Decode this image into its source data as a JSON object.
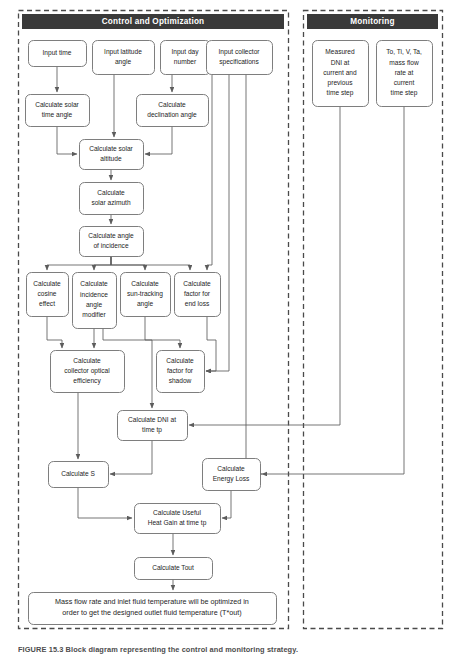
{
  "figure": {
    "caption": "FIGURE 15.3   Block diagram representing the control and monitoring strategy.",
    "background_color": "#ffffff",
    "header_fill": "#3a3a3a",
    "header_text_color": "#ffffff",
    "node_stroke": "#6f6f6f",
    "edge_color": "#5c5c5c",
    "panel_border_color": "#4a4a4a"
  },
  "panels": [
    {
      "id": "control",
      "title": "Control and Optimization",
      "x": 18,
      "y": 10,
      "width": 270,
      "height": 618
    },
    {
      "id": "monitoring",
      "title": "Monitoring",
      "x": 303,
      "y": 10,
      "width": 139,
      "height": 618
    }
  ],
  "nodes": [
    {
      "id": "input_time",
      "label": [
        "Input time"
      ],
      "x": 28,
      "y": 40,
      "w": 58,
      "h": 26,
      "panel": "control"
    },
    {
      "id": "input_latitude",
      "label": [
        "Input latitude",
        "angle"
      ],
      "x": 92,
      "y": 40,
      "w": 62,
      "h": 34,
      "panel": "control"
    },
    {
      "id": "input_day",
      "label": [
        "Input day",
        "number"
      ],
      "x": 160,
      "y": 40,
      "w": 50,
      "h": 34,
      "panel": "control"
    },
    {
      "id": "input_collector",
      "label": [
        "Input collector",
        "specifications"
      ],
      "x": 206,
      "y": 40,
      "w": 66,
      "h": 34,
      "panel": "control"
    },
    {
      "id": "calc_solar_time",
      "label": [
        "Calculate solar",
        "time angle"
      ],
      "x": 25,
      "y": 94,
      "w": 64,
      "h": 32,
      "panel": "control"
    },
    {
      "id": "calc_declination",
      "label": [
        "Calculate",
        "declination angle"
      ],
      "x": 136,
      "y": 94,
      "w": 72,
      "h": 32,
      "panel": "control"
    },
    {
      "id": "calc_altitude",
      "label": [
        "Calculate solar",
        "altitude"
      ],
      "x": 79,
      "y": 139,
      "w": 64,
      "h": 30,
      "panel": "control"
    },
    {
      "id": "calc_azimuth",
      "label": [
        "Calculate",
        "solar azimuth"
      ],
      "x": 79,
      "y": 182,
      "w": 64,
      "h": 32,
      "panel": "control"
    },
    {
      "id": "calc_incidence",
      "label": [
        "Calculate angle",
        "of incidence"
      ],
      "x": 79,
      "y": 226,
      "w": 64,
      "h": 30,
      "panel": "control"
    },
    {
      "id": "calc_cosine",
      "label": [
        "Calculate",
        "cosine",
        "effect"
      ],
      "x": 26,
      "y": 272,
      "w": 42,
      "h": 44,
      "panel": "control"
    },
    {
      "id": "calc_iam",
      "label": [
        "Calculate",
        "incidence",
        "angle",
        "modifier"
      ],
      "x": 72,
      "y": 272,
      "w": 44,
      "h": 56,
      "panel": "control"
    },
    {
      "id": "calc_suntrack",
      "label": [
        "Calculate",
        "sun-tracking",
        "angle"
      ],
      "x": 120,
      "y": 272,
      "w": 50,
      "h": 44,
      "panel": "control"
    },
    {
      "id": "calc_endloss",
      "label": [
        "Calculate",
        "factor for",
        "end loss"
      ],
      "x": 174,
      "y": 272,
      "w": 46,
      "h": 44,
      "panel": "control"
    },
    {
      "id": "calc_optical",
      "label": [
        "Calculate",
        "collector optical",
        "efficiency"
      ],
      "x": 50,
      "y": 350,
      "w": 74,
      "h": 42,
      "panel": "control"
    },
    {
      "id": "calc_shadow",
      "label": [
        "Calculate",
        "factor for",
        "shadow"
      ],
      "x": 156,
      "y": 350,
      "w": 48,
      "h": 42,
      "panel": "control"
    },
    {
      "id": "calc_dni",
      "label": [
        "Calculate DNI at",
        "time tp"
      ],
      "x": 117,
      "y": 410,
      "w": 70,
      "h": 30,
      "panel": "control"
    },
    {
      "id": "calc_s",
      "label": [
        "Calculate S"
      ],
      "x": 48,
      "y": 461,
      "w": 60,
      "h": 26,
      "panel": "control"
    },
    {
      "id": "calc_energyloss",
      "label": [
        "Calculate",
        "Energy Loss"
      ],
      "x": 202,
      "y": 458,
      "w": 58,
      "h": 32,
      "panel": "control"
    },
    {
      "id": "calc_useful",
      "label": [
        "Calculate Useful",
        "Heat Gain at time tp"
      ],
      "x": 134,
      "y": 503,
      "w": 86,
      "h": 30,
      "panel": "control"
    },
    {
      "id": "calc_tout",
      "label": [
        "Calculate Tout"
      ],
      "x": 134,
      "y": 557,
      "w": 78,
      "h": 22,
      "panel": "control"
    },
    {
      "id": "optimize_note",
      "label": [
        "Mass flow rate and inlet fluid temperature will be optimized in",
        "order to get the designed outlet fluid temperature (T*out)"
      ],
      "x": 28,
      "y": 592,
      "w": 248,
      "h": 32,
      "panel": "control"
    },
    {
      "id": "measured_dni",
      "label": [
        "Measured",
        "DNI at",
        "current and",
        "previous",
        "time step"
      ],
      "x": 312,
      "y": 40,
      "w": 56,
      "h": 66,
      "panel": "monitoring"
    },
    {
      "id": "measured_temps",
      "label": [
        "To, Ti, V, Ta,",
        "mass flow",
        "rate at",
        "current",
        "time step"
      ],
      "x": 376,
      "y": 40,
      "w": 56,
      "h": 66,
      "panel": "monitoring"
    }
  ],
  "edges": [
    {
      "id": "e-input_time-calc_solar_time",
      "from": "input_time",
      "to": "calc_solar_time",
      "arrow": true
    },
    {
      "id": "e-input_day-calc_declination",
      "from": "input_day",
      "to": "calc_declination",
      "arrow": true
    },
    {
      "id": "e-input_latitude-calc_altitude",
      "from": "input_latitude",
      "to": "calc_altitude",
      "arrow": true
    },
    {
      "id": "e-calc_solar_time-calc_altitude",
      "from": "calc_solar_time",
      "to": "calc_altitude",
      "arrow": true
    },
    {
      "id": "e-calc_declination-calc_altitude",
      "from": "calc_declination",
      "to": "calc_altitude",
      "arrow": true
    },
    {
      "id": "e-calc_altitude-calc_azimuth",
      "from": "calc_altitude",
      "to": "calc_azimuth",
      "arrow": true
    },
    {
      "id": "e-calc_azimuth-calc_incidence",
      "from": "calc_azimuth",
      "to": "calc_incidence",
      "arrow": true
    },
    {
      "id": "e-calc_incidence-calc_cosine",
      "from": "calc_incidence",
      "to": "calc_cosine",
      "arrow": true
    },
    {
      "id": "e-calc_incidence-calc_iam",
      "from": "calc_incidence",
      "to": "calc_iam",
      "arrow": true
    },
    {
      "id": "e-calc_incidence-calc_suntrack",
      "from": "calc_incidence",
      "to": "calc_suntrack",
      "arrow": true
    },
    {
      "id": "e-calc_incidence-calc_endloss",
      "from": "calc_incidence",
      "to": "calc_endloss",
      "arrow": true
    },
    {
      "id": "e-input_collector-calc_endloss",
      "from": "input_collector",
      "to": "calc_endloss",
      "arrow": true
    },
    {
      "id": "e-input_collector-calc_shadow",
      "from": "input_collector",
      "to": "calc_shadow",
      "arrow": true
    },
    {
      "id": "e-input_collector-calc_energyloss",
      "from": "input_collector",
      "to": "calc_energyloss",
      "arrow": true
    },
    {
      "id": "e-calc_cosine-calc_optical",
      "from": "calc_cosine",
      "to": "calc_optical",
      "arrow": true
    },
    {
      "id": "e-calc_iam-calc_optical",
      "from": "calc_iam",
      "to": "calc_optical",
      "arrow": true
    },
    {
      "id": "e-calc_suntrack-calc_shadow",
      "from": "calc_suntrack",
      "to": "calc_shadow",
      "arrow": true
    },
    {
      "id": "e-calc_iam-calc_dni",
      "from": "calc_iam",
      "to": "calc_dni",
      "arrow": true
    },
    {
      "id": "e-calc_endloss-calc_shadow",
      "from": "calc_endloss",
      "to": "calc_shadow",
      "arrow": true
    },
    {
      "id": "e-calc_optical-calc_s",
      "from": "calc_optical",
      "to": "calc_s",
      "arrow": true
    },
    {
      "id": "e-calc_dni-calc_s",
      "from": "calc_dni",
      "to": "calc_s",
      "arrow": true
    },
    {
      "id": "e-calc_s-calc_useful",
      "from": "calc_s",
      "to": "calc_useful",
      "arrow": true
    },
    {
      "id": "e-calc_energyloss-calc_useful",
      "from": "calc_energyloss",
      "to": "calc_useful",
      "arrow": true
    },
    {
      "id": "e-calc_useful-calc_tout",
      "from": "calc_useful",
      "to": "calc_tout",
      "arrow": true
    },
    {
      "id": "e-calc_tout-optimize_note",
      "from": "calc_tout",
      "to": "optimize_note",
      "arrow": true
    },
    {
      "id": "e-measured_dni-calc_dni",
      "from": "measured_dni",
      "to": "calc_dni",
      "arrow": true
    },
    {
      "id": "e-measured_temps-calc_energyloss",
      "from": "measured_temps",
      "to": "calc_energyloss",
      "arrow": true
    }
  ],
  "edge_paths": {
    "e-input_time-calc_solar_time": "M57,66 L57,92",
    "e-input_day-calc_declination": "M172,74 L172,92",
    "e-input_latitude-calc_altitude": "M114,74 L114,137",
    "e-calc_solar_time-calc_altitude": "M57,126 L57,154 L77,154",
    "e-calc_declination-calc_altitude": "M172,126 L172,154 L145,154",
    "e-calc_altitude-calc_azimuth": "M111,169 L111,180",
    "e-calc_azimuth-calc_incidence": "M111,214 L111,224",
    "e-calc_incidence-calc_cosine": "M111,256 L111,265 L47,265 L47,270",
    "e-calc_incidence-calc_iam": "M111,256 L111,265 L94,265 L94,270",
    "e-calc_incidence-calc_suntrack": "M111,256 L111,265 L145,265 L145,270",
    "e-calc_incidence-calc_endloss": "M111,256 L111,265 L190,265 L190,270",
    "e-input_collector-calc_endloss": "M212,74 L212,265 L207,265 L207,270",
    "e-input_collector-calc_shadow": "M229,74 L229,371 L206,371",
    "e-input_collector-calc_energyloss": "M246,74 L246,474 L262,474",
    "e-calc_cosine-calc_optical": "M47,316 L47,340 L62,340 L62,348",
    "e-calc_iam-calc_optical": "M94,328 L94,348",
    "e-calc_suntrack-calc_shadow": "M145,316 L145,340 L180,340 L180,348",
    "e-calc_iam-calc_dni": "M103,328 L103,340 L152,340 L152,408",
    "e-calc_endloss-calc_shadow": "M207,316 L207,340 L216,340 L216,371 L206,371",
    "e-calc_optical-calc_s": "M78,392 L78,459",
    "e-calc_dni-calc_s": "M152,440 L152,474 L110,474",
    "e-calc_s-calc_useful": "M78,487 L78,518 L132,518",
    "e-calc_energyloss-calc_useful": "M231,490 L231,518 L222,518",
    "e-calc_useful-calc_tout": "M173,533 L173,555",
    "e-calc_tout-optimize_note": "M173,579 L173,590",
    "e-measured_dni-calc_dni": "M340,106 L340,425 L189,425",
    "e-measured_temps-calc_energyloss": "M404,106 L404,474 L262,474"
  }
}
